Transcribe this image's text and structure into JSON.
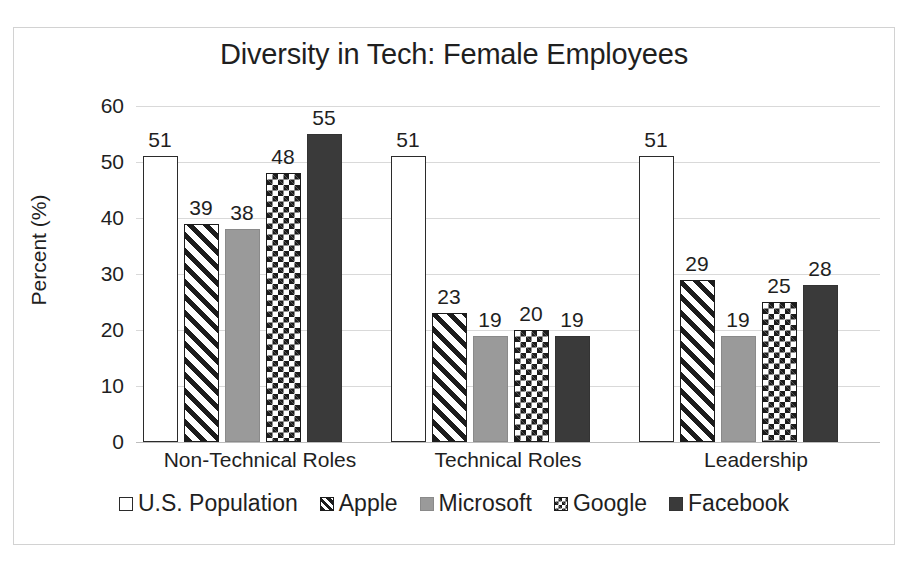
{
  "chart_data": {
    "type": "bar",
    "title": "Diversity in Tech: Female Employees",
    "xlabel": "",
    "ylabel": "Percent (%)",
    "ylim": [
      0,
      60
    ],
    "ytick_step": 10,
    "yticks": [
      "60",
      "50",
      "40",
      "30",
      "20",
      "10",
      "0"
    ],
    "grid": true,
    "legend_position": "bottom",
    "categories": [
      "Non-Technical Roles",
      "Technical Roles",
      "Leadership"
    ],
    "series": [
      {
        "name": "U.S. Population",
        "values": [
          51,
          51,
          51
        ],
        "pattern": "white-outline",
        "color": "#ffffff"
      },
      {
        "name": "Apple",
        "values": [
          39,
          23,
          29
        ],
        "pattern": "diagonal-stripe",
        "color": "#1c1c1c"
      },
      {
        "name": "Microsoft",
        "values": [
          38,
          19,
          19
        ],
        "pattern": "solid-gray",
        "color": "#9a9a9a"
      },
      {
        "name": "Google",
        "values": [
          48,
          20,
          25
        ],
        "pattern": "checkerboard",
        "color": "#1c1c1c"
      },
      {
        "name": "Facebook",
        "values": [
          55,
          19,
          28
        ],
        "pattern": "solid-dark",
        "color": "#3a3a3a"
      }
    ],
    "data_labels": [
      [
        "51",
        "39",
        "38",
        "48",
        "55"
      ],
      [
        "51",
        "23",
        "19",
        "20",
        "19"
      ],
      [
        "51",
        "29",
        "19",
        "25",
        "28"
      ]
    ]
  },
  "legend": {
    "items": [
      {
        "label": "U.S. Population"
      },
      {
        "label": "Apple"
      },
      {
        "label": "Microsoft"
      },
      {
        "label": "Google"
      },
      {
        "label": "Facebook"
      }
    ]
  }
}
